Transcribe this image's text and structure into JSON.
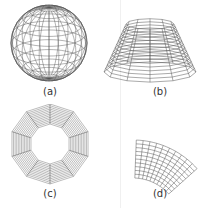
{
  "figure": {
    "panels": [
      {
        "id": "a",
        "label": "(a)",
        "shape": "wireframe sphere"
      },
      {
        "id": "b",
        "label": "(b)",
        "shape": "wireframe truncated cone (frustum)"
      },
      {
        "id": "c",
        "label": "(c)",
        "shape": "wireframe decagonal annulus"
      },
      {
        "id": "d",
        "label": "(d)",
        "shape": "wireframe annular sector patch"
      }
    ],
    "colors": {
      "line": "#555555",
      "background": "#ffffff",
      "label": "#333333"
    }
  }
}
